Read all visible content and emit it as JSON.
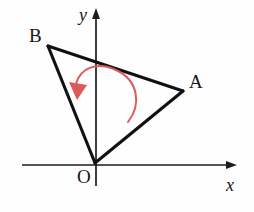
{
  "figure": {
    "background_color": "#fefefe",
    "width": 254,
    "height": 212
  },
  "colors": {
    "ink": "#111111",
    "axis": "#1d1d1d",
    "rotation_red": "#dd5a5a",
    "rotation_red_light": "#e58080"
  },
  "axes": {
    "x_axis": {
      "label": "x",
      "start_x": 22,
      "end_x": 237,
      "y": 165,
      "label_x": 232,
      "label_y": 190,
      "arrow_direction": "right"
    },
    "y_axis": {
      "label": "y",
      "x": 96,
      "top_y": 8,
      "bottom_y": 186,
      "label_x": 79,
      "label_y": 20,
      "arrow_direction": "up"
    },
    "origin": {
      "label": "O",
      "x": 95,
      "y": 163,
      "label_x": 78,
      "label_y": 182
    }
  },
  "triangle": {
    "name": "OAB",
    "vertices": [
      {
        "id": "O",
        "label": "O",
        "x": 95,
        "y": 163,
        "label_x": 78,
        "label_y": 182
      },
      {
        "id": "A",
        "label": "A",
        "x": 183,
        "y": 91,
        "label_x": 190,
        "label_y": 87
      },
      {
        "id": "B",
        "label": "B",
        "x": 48,
        "y": 46,
        "label_x": 30,
        "label_y": 41
      }
    ],
    "edges": [
      {
        "from": "O",
        "to": "B"
      },
      {
        "from": "B",
        "to": "A"
      },
      {
        "from": "A",
        "to": "O"
      }
    ]
  },
  "rotation_arrow": {
    "description": "counterclockwise curved arrow inside triangle",
    "direction": "counterclockwise",
    "color": "#dd5a5a",
    "arc_path": "M 128 122 C 142 104 138 80 116 70 C 97 61 80 68 76 84",
    "head_tip_x": 77,
    "head_tip_y": 99,
    "head_points": "77,100 69,82 87,85"
  }
}
